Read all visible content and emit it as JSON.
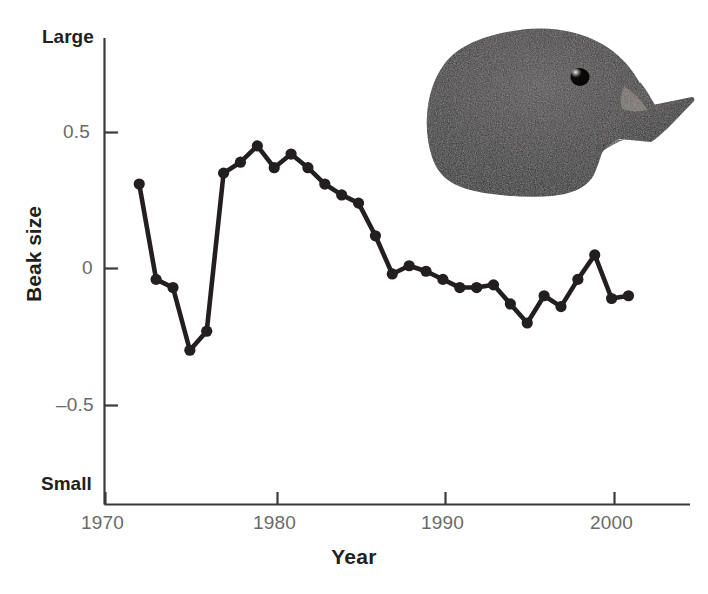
{
  "figure": {
    "background_color": "#ffffff",
    "ink_color": "#231f20",
    "tick_label_color": "#6a6a6a"
  },
  "axes": {
    "y_title": "Beak size",
    "x_title": "Year",
    "y_top_label": "Large",
    "y_bottom_label": "Small",
    "y_ticks": [
      "0.5",
      "0",
      "–0.5"
    ],
    "x_ticks": [
      "1970",
      "1980",
      "1990",
      "2000"
    ]
  },
  "photo": {
    "caption": "darwin-finch-head-photo",
    "alt": "Head of a Darwin's finch showing a deep conical beak"
  },
  "chart_data": {
    "type": "line",
    "title": "",
    "subtitle": "",
    "xlabel": "Year",
    "ylabel": "Beak size",
    "xlim": [
      1970,
      2002
    ],
    "ylim": [
      -0.85,
      0.85
    ],
    "xticks": [
      1970,
      1980,
      1990,
      2000
    ],
    "yticks": [
      0.5,
      0,
      -0.5
    ],
    "ytick_labels": [
      "0.5",
      "0",
      "–0.5"
    ],
    "y_axis_extremes": {
      "top": "Large",
      "bottom": "Small"
    },
    "grid": false,
    "legend": null,
    "marker": "filled-circle",
    "series": [
      {
        "name": "Mean beak size",
        "x": [
          1972,
          1973,
          1974,
          1975,
          1976,
          1977,
          1978,
          1979,
          1980,
          1981,
          1982,
          1983,
          1984,
          1985,
          1986,
          1987,
          1988,
          1989,
          1990,
          1991,
          1992,
          1993,
          1994,
          1995,
          1996,
          1997,
          1998,
          1999,
          2000,
          2001
        ],
        "y": [
          0.31,
          -0.04,
          -0.07,
          -0.3,
          -0.23,
          0.35,
          0.39,
          0.45,
          0.37,
          0.42,
          0.37,
          0.31,
          0.27,
          0.24,
          0.12,
          -0.02,
          0.01,
          -0.01,
          -0.04,
          -0.07,
          -0.07,
          -0.06,
          -0.13,
          -0.2,
          -0.1,
          -0.14,
          -0.04,
          0.05,
          -0.11,
          -0.1
        ]
      }
    ]
  }
}
